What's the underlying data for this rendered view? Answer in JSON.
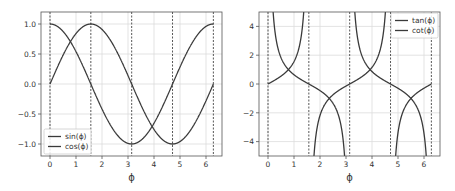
{
  "chart_data": [
    {
      "type": "line",
      "title": "",
      "xlabel": "ϕ",
      "ylabel": "",
      "xlim": [
        -0.314,
        6.597
      ],
      "ylim": [
        -1.2,
        1.2
      ],
      "xticks": [
        0,
        1,
        2,
        3,
        4,
        5,
        6
      ],
      "xtick_labels": [
        "0",
        "1",
        "2",
        "3",
        "4",
        "5",
        "6"
      ],
      "yticks": [
        1.0,
        0.5,
        0.0,
        -0.5,
        -1.0
      ],
      "ytick_labels": [
        "1.0",
        "0.5",
        "0.0",
        "−0.5",
        "−1.0"
      ],
      "grid": true,
      "legend_position": "lower left",
      "vlines": {
        "style": "dashed",
        "x": [
          0,
          1.5708,
          3.1416,
          4.7124,
          6.2832
        ]
      },
      "series": [
        {
          "name": "sin(ϕ)",
          "function": "sin",
          "x_range": [
            0,
            6.2832
          ],
          "x": [
            0,
            0.7854,
            1.5708,
            2.3562,
            3.1416,
            3.927,
            4.7124,
            5.4978,
            6.2832
          ],
          "values": [
            0,
            0.707,
            1,
            0.707,
            0,
            -0.707,
            -1,
            -0.707,
            0
          ]
        },
        {
          "name": "cos(ϕ)",
          "function": "cos",
          "x_range": [
            0,
            6.2832
          ],
          "x": [
            0,
            0.7854,
            1.5708,
            2.3562,
            3.1416,
            3.927,
            4.7124,
            5.4978,
            6.2832
          ],
          "values": [
            1,
            0.707,
            0,
            -0.707,
            -1,
            -0.707,
            0,
            0.707,
            1
          ]
        }
      ]
    },
    {
      "type": "line",
      "title": "",
      "xlabel": "ϕ",
      "ylabel": "",
      "xlim": [
        -0.314,
        6.597
      ],
      "ylim": [
        -5,
        5
      ],
      "xticks": [
        0,
        1,
        2,
        3,
        4,
        5,
        6
      ],
      "xtick_labels": [
        "0",
        "1",
        "2",
        "3",
        "4",
        "5",
        "6"
      ],
      "yticks": [
        4,
        2,
        0,
        -2,
        -4
      ],
      "ytick_labels": [
        "4",
        "2",
        "0",
        "−2",
        "−4"
      ],
      "grid": true,
      "legend_position": "upper right",
      "vlines": {
        "style": "dashed",
        "x": [
          0,
          1.5708,
          3.1416,
          4.7124,
          6.2832
        ]
      },
      "series": [
        {
          "name": "tan(ϕ)",
          "function": "tan",
          "x_range": [
            0,
            6.2832
          ],
          "x": [
            0,
            0.7854,
            2.3562,
            3.1416,
            3.927,
            5.4978,
            6.2832
          ],
          "values": [
            0,
            1,
            -1,
            0,
            1,
            -1,
            0
          ]
        },
        {
          "name": "cot(ϕ)",
          "function": "cot",
          "x_range": [
            0,
            6.2832
          ],
          "x": [
            0.7854,
            1.5708,
            2.3562,
            3.927,
            4.7124,
            5.4978
          ],
          "values": [
            1,
            0,
            -1,
            1,
            0,
            -1
          ]
        }
      ]
    }
  ],
  "style": {
    "line_color": "#3a3a3a",
    "grid_color": "#dcdcdc",
    "spine_color": "#555555",
    "vline_color": "#444444",
    "legend_border": "#cccccc"
  },
  "layout": {
    "axes": [
      {
        "left": 41,
        "top": 12,
        "right": 222,
        "bottom": 156,
        "x0_px": 50,
        "px_per_unit_x": 26
      },
      {
        "left": 259,
        "top": 12,
        "right": 440,
        "bottom": 156,
        "x0_px": 268,
        "px_per_unit_x": 26
      }
    ]
  }
}
